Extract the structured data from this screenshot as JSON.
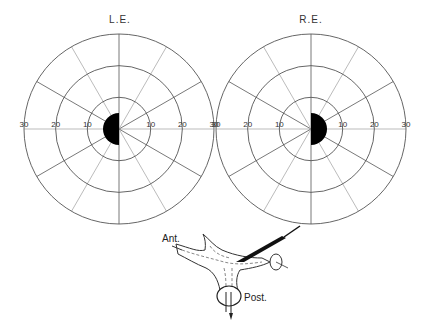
{
  "fields": [
    {
      "label": "L.E.",
      "cx": 119,
      "cy": 129,
      "rings_deg": [
        10,
        20,
        30
      ],
      "tick_labels_left": [
        "30",
        "20",
        "10"
      ],
      "tick_labels_right": [
        "10",
        "20",
        "30"
      ],
      "blind_spot": {
        "side": "left",
        "radius_deg": 5,
        "shape": "half-disk",
        "fill": "#000000"
      }
    },
    {
      "label": "R.E.",
      "cx": 311,
      "cy": 129,
      "rings_deg": [
        10,
        20,
        30
      ],
      "tick_labels_left": [
        "30",
        "20",
        "10"
      ],
      "tick_labels_right": [
        "10",
        "20",
        "30"
      ],
      "blind_spot": {
        "side": "right",
        "radius_deg": 5,
        "shape": "half-disk",
        "fill": "#000000"
      }
    }
  ],
  "spoke_interval_deg": 30,
  "diagram": {
    "label_anterior": "Ant.",
    "label_posterior": "Post."
  },
  "colors": {
    "line": "#555555",
    "light_line": "#aaaaaa",
    "fill": "#000000"
  }
}
